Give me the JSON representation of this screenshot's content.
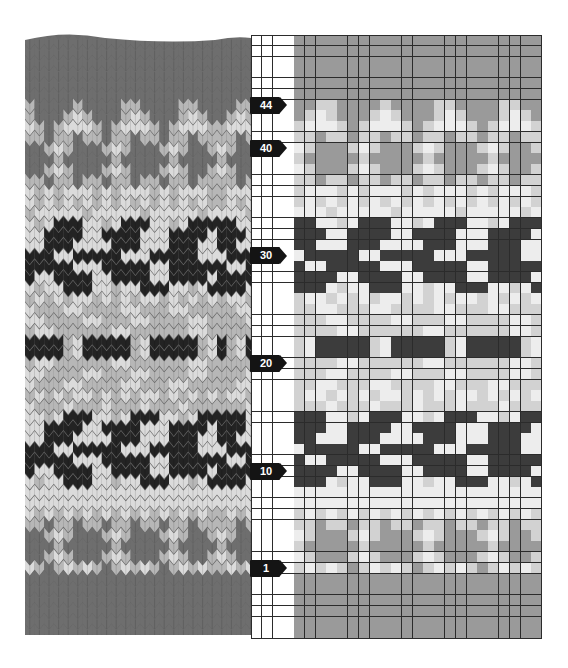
{
  "figure": {
    "title": "",
    "photo_label": "Knitted Fair Isle swatch",
    "chart_label": "Knitting colour chart"
  },
  "colors": {
    "white": "#fbfbfb",
    "light": "#d2d2d2",
    "medium": "#9a9a9a",
    "dark": "#3c3c3c",
    "gridline": "#2b2b2b",
    "marker": "#141414"
  },
  "chart_data": {
    "type": "heatmap",
    "title": "",
    "xlabel": "",
    "ylabel": "Row",
    "legend": {
      ".": "white (unused margin / background)",
      "l": "light yarn",
      "m": "medium yarn",
      "d": "dark yarn"
    },
    "row_markers": [
      "44",
      "40",
      "30",
      "20",
      "10",
      "1"
    ],
    "margin_columns": 4,
    "pattern_columns": 23,
    "first_row_number": 50,
    "rows": [
      {
        "row": 50,
        "cells": "mmmmmmmmmmmmmmmmmmmmmmm"
      },
      {
        "row": 49,
        "cells": "mmmmmmmmmmmmmmmmmmmmmmm"
      },
      {
        "row": 48,
        "cells": "mmmmmmmmmmmmmmmmmmmmmmm"
      },
      {
        "row": 47,
        "cells": "mmmmmmmmmmmmmmmmmmmmmmm"
      },
      {
        "row": 46,
        "cells": "mmmmmmmmmmmmmmmmmmmmmmm"
      },
      {
        "row": 45,
        "cells": "mmmmmmmmmmmmmmmmmmmmmmm"
      },
      {
        "row": 44,
        "cells": "mmllmmmmlmmmmllmmmmllmm"
      },
      {
        "row": 43,
        "cells": "ml.lmmml.lmmml.lmmml.lm"
      },
      {
        "row": 42,
        "cells": "l...lml...lml...lml...l"
      },
      {
        "row": 41,
        "cells": "llmllmllmllmllmllmllmll"
      },
      {
        "row": 40,
        "cells": ".lmmml.lmmml.lmmml.lmml"
      },
      {
        "row": 39,
        "cells": "lmmmmmlmmmmmlmmmmmlmmmm"
      },
      {
        "row": 38,
        "cells": ".lmmml.lmmml.lmmml.lmml"
      },
      {
        "row": 37,
        "cells": "llmllmllmllmllmllmllmll"
      },
      {
        "row": 36,
        "cells": "l...l.l...l.l...l.l...l"
      },
      {
        "row": 35,
        "cells": "l.l.l.l.l.l.l.l.l.l.l.l"
      },
      {
        "row": 34,
        "cells": "...l.....l.....l.....l."
      },
      {
        "row": 33,
        "cells": "dd..l.ddd..l.ddd..l.ddd"
      },
      {
        "row": 32,
        "cells": "ddd..dddd..dddd...dddd."
      },
      {
        "row": 31,
        "cells": "dd...ddd....ddd...ddd.."
      },
      {
        "row": 30,
        "cells": ".ddddd..ddddd...ddddd.."
      },
      {
        "row": 29,
        "cells": "d..ddddd...ddddd..ddddd"
      },
      {
        "row": 28,
        "cells": "dddd..dddd..dddd..dddd."
      },
      {
        "row": 27,
        "cells": "ddd.l..ddd..l..ddd..l.d"
      },
      {
        "row": 26,
        "cells": "l..l.l.l..l.l.l..l.l.l."
      },
      {
        "row": 25,
        "cells": "ll..lll..llll..lll..lll"
      },
      {
        "row": 24,
        "cells": "lll..llll..lll..llll..l"
      },
      {
        "row": 23,
        "cells": "llll..llllll..llllll..l"
      },
      {
        "row": 22,
        "cells": "l.dddddl.dddddl.dddddl.d"
      },
      {
        "row": 21,
        "cells": "l.dddddl.dddddl.dddddl.d"
      },
      {
        "row": 20,
        "cells": "llll..llllll..llllll..l"
      },
      {
        "row": 19,
        "cells": "lll..llll..lll..llll..l"
      },
      {
        "row": 18,
        "cells": "ll..lll..llll..lll..lll"
      },
      {
        "row": 17,
        "cells": "l..l.l.l..l.l.l..l.l.l."
      },
      {
        "row": 16,
        "cells": "lll.lll.lll.lll.lll.lll"
      },
      {
        "row": 15,
        "cells": "ddd..l.ddd..l.ddd..l.dd"
      },
      {
        "row": 14,
        "cells": "ddd..dddd..dddd...dddd."
      },
      {
        "row": 13,
        "cells": "dd...ddd....ddd...ddd.."
      },
      {
        "row": 12,
        "cells": ".ddddd..ddddd...ddddd.."
      },
      {
        "row": 11,
        "cells": "d..ddddd...ddddd..ddddd"
      },
      {
        "row": 10,
        "cells": "dddd..dddd..dddd..dddd."
      },
      {
        "row": 9,
        "cells": "ddd.l..ddd..l..ddd..l.d"
      },
      {
        "row": 8,
        "cells": "......................."
      },
      {
        "row": 7,
        "cells": "......................."
      },
      {
        "row": 6,
        "cells": "l.l.l.l.l.l.l.l.l.l.l.l"
      },
      {
        "row": 5,
        "cells": "llmllmllmllmllmllmllmll"
      },
      {
        "row": 4,
        "cells": ".lmmml.lmmml.lmmml.lmml"
      },
      {
        "row": 3,
        "cells": "lmmmmmlmmmmmlmmmmmlmmmm"
      },
      {
        "row": 2,
        "cells": ".lmmml.lmmml.lmmml.lmml"
      },
      {
        "row": 1,
        "cells": "l.l.lml.l.lml.l.lml.l.l"
      },
      {
        "row": 0,
        "cells": "mmmmmmmmmmmmmmmmmmmmmmm"
      },
      {
        "row": -1,
        "cells": "mmmmmmmmmmmmmmmmmmmmmmm"
      },
      {
        "row": -2,
        "cells": "mmmmmmmmmmmmmmmmmmmmmmm"
      },
      {
        "row": -3,
        "cells": "mmmmmmmmmmmmmmmmmmmmmmm"
      },
      {
        "row": -4,
        "cells": "mmmmmmmmmmmmmmmmmmmmmmm"
      },
      {
        "row": -5,
        "cells": "mmmmmmmmmmmmmmmmmmmmmmm"
      }
    ]
  }
}
